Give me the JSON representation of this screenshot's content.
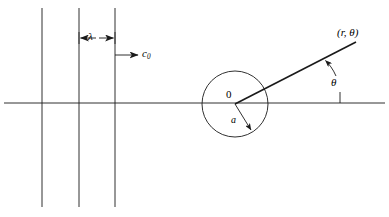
{
  "figure": {
    "background_color": "#ffffff",
    "line_color": "#1a1a1a",
    "labels": {
      "wavelength": "λ",
      "wave_speed": "c",
      "wave_speed_sub": "0",
      "origin": "0",
      "radius": "a",
      "angle": "θ",
      "field_point": "(r, θ)"
    },
    "geometry": {
      "axis": {
        "y": 103,
        "x_start": 4,
        "x_end": 385
      },
      "wavefronts_x": [
        42,
        79,
        115
      ],
      "wavefront_y_top": 8,
      "wavefront_y_bottom": 207,
      "lambda_arrow_y": 38,
      "c0_arrow_y": 55,
      "c0_arrow_x_start": 115,
      "c0_arrow_x_end": 138,
      "circle_center_x": 235,
      "circle_center_y": 104,
      "circle_radius": 33,
      "ray_end_x": 356,
      "ray_end_y": 42,
      "reference_tick_x": 340,
      "reference_tick_y_top": 92,
      "reference_tick_y_bottom": 103,
      "radius_arrow_end_x": 252,
      "radius_arrow_end_y": 132
    }
  }
}
